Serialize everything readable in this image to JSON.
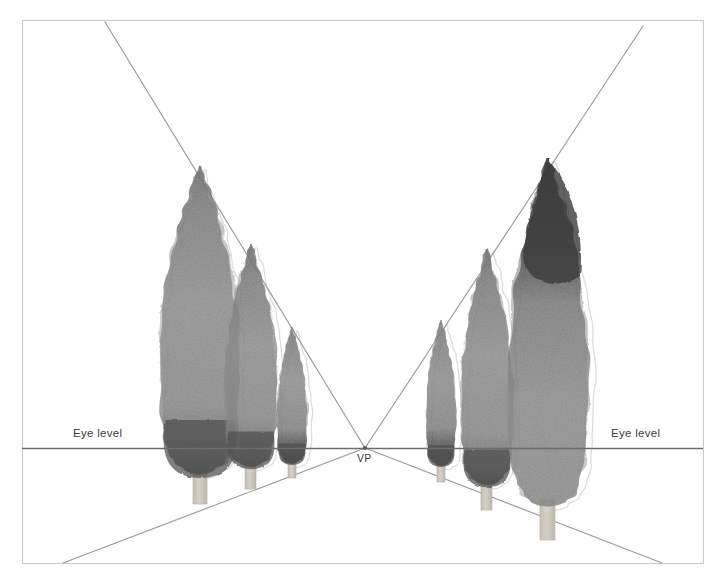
{
  "figure": {
    "kind": "perspective-drawing",
    "medium": "watercolor-and-ink",
    "background_color": "#ffffff",
    "clipped_caption": "",
    "frame": {
      "name": "drawing-border",
      "x": 22,
      "y": 20,
      "width": 681,
      "height": 543,
      "stroke": "#c9c9c9",
      "stroke_width": 1
    },
    "horizon": {
      "name": "eye-level-line",
      "y": 448,
      "x1": 22,
      "x2": 703,
      "stroke": "#6d6d6d",
      "stroke_width": 1.4
    },
    "vanishing_point": {
      "x": 365,
      "y": 448
    }
  },
  "labels": {
    "eye_level_left": "Eye level",
    "eye_level_right": "Eye level",
    "vanishing_point": "VP"
  },
  "colors": {
    "frame_line": "#c9c9c9",
    "horizon_line": "#6d6d6d",
    "convergence_line": "#9a9a9a",
    "foliage_mid": "#8e8e8e",
    "foliage_light": "#a2a2a2",
    "foliage_dark": "#4f4f4f",
    "foliage_darkest": "#3a3a3a",
    "trunk": "#cfc9bf",
    "pencil_ghost": "#dedad4",
    "label_text": "#3b3b3b"
  },
  "convergence_lines": [
    {
      "name": "top-left-to-vp",
      "x1": 105,
      "y1": 22,
      "x2": 365,
      "y2": 448
    },
    {
      "name": "top-right-to-vp",
      "x1": 643,
      "y1": 26,
      "x2": 365,
      "y2": 448
    },
    {
      "name": "bottom-left-to-vp",
      "x1": 63,
      "y1": 563,
      "x2": 365,
      "y2": 448
    },
    {
      "name": "bottom-right-to-vp",
      "x1": 662,
      "y1": 563,
      "x2": 365,
      "y2": 448
    }
  ],
  "trees": [
    {
      "id": "tree-left-1",
      "side": "left",
      "order": 1,
      "apex_x": 200,
      "apex_y": 166,
      "base_y": 470,
      "half_width": 40,
      "trunk": {
        "x": 193,
        "y_top": 468,
        "width": 14,
        "height": 36
      },
      "dark_base": true,
      "dark_top": false
    },
    {
      "id": "tree-left-2",
      "side": "left",
      "order": 2,
      "apex_x": 251,
      "apex_y": 244,
      "base_y": 464,
      "half_width": 26,
      "trunk": {
        "x": 245,
        "y_top": 462,
        "width": 11,
        "height": 27
      },
      "dark_base": true,
      "dark_top": false
    },
    {
      "id": "tree-left-3",
      "side": "left",
      "order": 3,
      "apex_x": 292,
      "apex_y": 327,
      "base_y": 462,
      "half_width": 15,
      "trunk": {
        "x": 288,
        "y_top": 460,
        "width": 8,
        "height": 18
      },
      "dark_base": true,
      "dark_top": false
    },
    {
      "id": "tree-right-1",
      "side": "right",
      "order": 3,
      "apex_x": 441,
      "apex_y": 320,
      "base_y": 464,
      "half_width": 15,
      "trunk": {
        "x": 437,
        "y_top": 462,
        "width": 8,
        "height": 20
      },
      "dark_base": true,
      "dark_top": false
    },
    {
      "id": "tree-right-2",
      "side": "right",
      "order": 2,
      "apex_x": 487,
      "apex_y": 249,
      "base_y": 482,
      "half_width": 26,
      "trunk": {
        "x": 481,
        "y_top": 480,
        "width": 11,
        "height": 30
      },
      "dark_base": true,
      "dark_top": false
    },
    {
      "id": "tree-right-3",
      "side": "right",
      "order": 1,
      "apex_x": 548,
      "apex_y": 158,
      "base_y": 502,
      "half_width": 40,
      "trunk": {
        "x": 540,
        "y_top": 500,
        "width": 15,
        "height": 40
      },
      "dark_base": false,
      "dark_top": true
    }
  ]
}
